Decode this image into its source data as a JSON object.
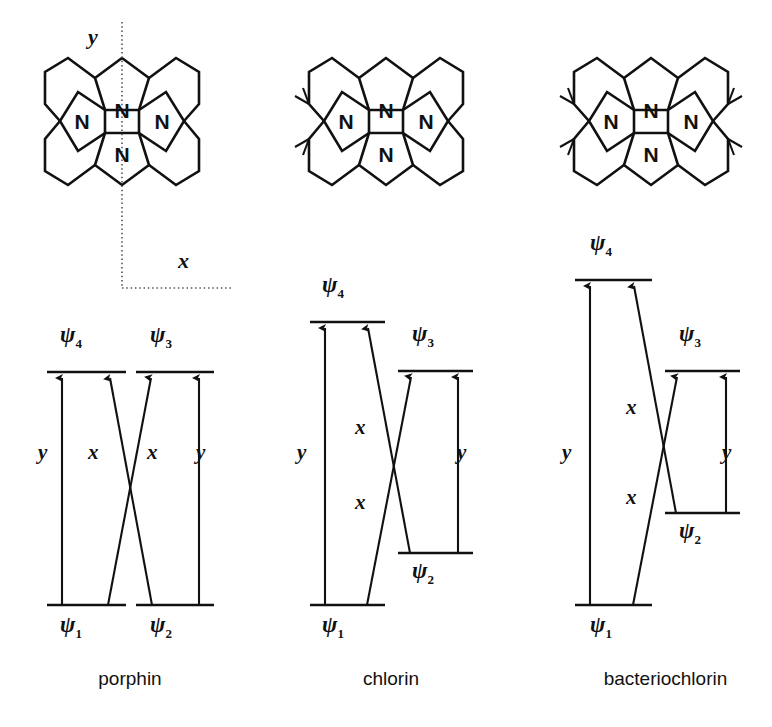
{
  "figure": {
    "background_color": "#ffffff",
    "ink_color": "#111111"
  },
  "axes": {
    "y_label": "y",
    "x_label": "x",
    "style": "dotted"
  },
  "molecules": [
    {
      "id": "porphin",
      "name": "porphin",
      "nitrogen_label": "N",
      "nitrogen_count": 4,
      "reduced_rings": 0,
      "methyl_sides": []
    },
    {
      "id": "chlorin",
      "name": "chlorin",
      "nitrogen_label": "N",
      "nitrogen_count": 4,
      "reduced_rings": 1,
      "methyl_sides": [
        "left"
      ]
    },
    {
      "id": "bacteriochlorin",
      "name": "bacteriochlorin",
      "nitrogen_label": "N",
      "nitrogen_count": 4,
      "reduced_rings": 2,
      "methyl_sides": [
        "left",
        "right"
      ]
    }
  ],
  "diagrams": [
    {
      "id": "porphin",
      "caption": "porphin",
      "levels": {
        "psi1": {
          "label": "ψ",
          "sub": "1",
          "energy_y": 605,
          "x1": 47,
          "x2": 126
        },
        "psi2": {
          "label": "ψ",
          "sub": "2",
          "energy_y": 605,
          "x1": 136,
          "x2": 214
        },
        "psi3": {
          "label": "ψ",
          "sub": "3",
          "energy_y": 372,
          "x1": 136,
          "x2": 214
        },
        "psi4": {
          "label": "ψ",
          "sub": "4",
          "energy_y": 372,
          "x1": 47,
          "x2": 126
        }
      },
      "transitions": [
        {
          "from": "psi1",
          "to": "psi4",
          "polarization": "y",
          "label_x": 46,
          "label_y": 455
        },
        {
          "from": "psi2",
          "to": "psi4",
          "polarization": "x",
          "label_x": 95,
          "label_y": 455
        },
        {
          "from": "psi1",
          "to": "psi3",
          "polarization": "x",
          "label_x": 153,
          "label_y": 455
        },
        {
          "from": "psi2",
          "to": "psi3",
          "polarization": "y",
          "label_x": 200,
          "label_y": 455
        }
      ],
      "degenerate": true
    },
    {
      "id": "chlorin",
      "caption": "chlorin",
      "levels": {
        "psi1": {
          "label": "ψ",
          "sub": "1",
          "energy_y": 605,
          "x1": 310,
          "x2": 385
        },
        "psi2": {
          "label": "ψ",
          "sub": "2",
          "energy_y": 553,
          "x1": 398,
          "x2": 473
        },
        "psi3": {
          "label": "ψ",
          "sub": "3",
          "energy_y": 371,
          "x1": 398,
          "x2": 473
        },
        "psi4": {
          "label": "ψ",
          "sub": "4",
          "energy_y": 322,
          "x1": 310,
          "x2": 385
        }
      },
      "transitions": [
        {
          "from": "psi1",
          "to": "psi4",
          "polarization": "y",
          "label_x": 303,
          "label_y": 455
        },
        {
          "from": "psi2",
          "to": "psi4",
          "polarization": "x",
          "label_x": 360,
          "label_y": 430
        },
        {
          "from": "psi1",
          "to": "psi3",
          "polarization": "x",
          "label_x": 360,
          "label_y": 505
        },
        {
          "from": "psi2",
          "to": "psi3",
          "polarization": "y",
          "label_x": 462,
          "label_y": 455
        }
      ],
      "degenerate": false
    },
    {
      "id": "bacteriochlorin",
      "caption": "bacteriochlorin",
      "levels": {
        "psi1": {
          "label": "ψ",
          "sub": "1",
          "energy_y": 605,
          "x1": 575,
          "x2": 652
        },
        "psi2": {
          "label": "ψ",
          "sub": "2",
          "energy_y": 513,
          "x1": 665,
          "x2": 740
        },
        "psi3": {
          "label": "ψ",
          "sub": "3",
          "energy_y": 371,
          "x1": 665,
          "x2": 740
        },
        "psi4": {
          "label": "ψ",
          "sub": "4",
          "energy_y": 280,
          "x1": 575,
          "x2": 652
        }
      },
      "transitions": [
        {
          "from": "psi1",
          "to": "psi4",
          "polarization": "y",
          "label_x": 568,
          "label_y": 455
        },
        {
          "from": "psi2",
          "to": "psi4",
          "polarization": "x",
          "label_x": 632,
          "label_y": 410
        },
        {
          "from": "psi1",
          "to": "psi3",
          "polarization": "x",
          "label_x": 632,
          "label_y": 500
        },
        {
          "from": "psi2",
          "to": "psi3",
          "polarization": "y",
          "label_x": 728,
          "label_y": 455
        }
      ],
      "degenerate": false
    }
  ],
  "psi_symbol": "ψ",
  "level_labels": {
    "porphin": {
      "psi4": {
        "text": "ψ",
        "sub": "4",
        "x": 72,
        "y": 326
      },
      "psi3": {
        "text": "ψ",
        "sub": "3",
        "x": 161,
        "y": 326
      },
      "psi1": {
        "text": "ψ",
        "sub": "1",
        "x": 72,
        "y": 613
      },
      "psi2": {
        "text": "ψ",
        "sub": "2",
        "x": 161,
        "y": 613
      }
    },
    "chlorin": {
      "psi4": {
        "text": "ψ",
        "sub": "4",
        "x": 330,
        "y": 276
      },
      "psi3": {
        "text": "ψ",
        "sub": "3",
        "x": 421,
        "y": 325
      },
      "psi1": {
        "text": "ψ",
        "sub": "1",
        "x": 330,
        "y": 613
      },
      "psi2": {
        "text": "ψ",
        "sub": "2",
        "x": 421,
        "y": 561
      }
    },
    "bacteriochlorin": {
      "psi4": {
        "text": "ψ",
        "sub": "4",
        "x": 598,
        "y": 234
      },
      "psi3": {
        "text": "ψ",
        "sub": "3",
        "x": 688,
        "y": 325
      },
      "psi1": {
        "text": "ψ",
        "sub": "1",
        "x": 598,
        "y": 613
      },
      "psi2": {
        "text": "ψ",
        "sub": "2",
        "x": 688,
        "y": 521
      }
    }
  }
}
